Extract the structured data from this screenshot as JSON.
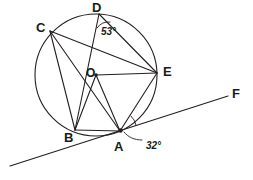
{
  "figure": {
    "type": "circle-geometry-diagram",
    "background_color": "#ffffff",
    "stroke_color": "#231f20",
    "canvas": {
      "width": 253,
      "height": 180
    }
  },
  "circle": {
    "center_label": "O",
    "center": {
      "x": 96,
      "y": 75
    },
    "radius": 61
  },
  "points": [
    {
      "label": "D",
      "x": 99,
      "y": 14,
      "label_x": 92,
      "label_y": 1,
      "name": "point-d"
    },
    {
      "label": "C",
      "x": 50,
      "y": 31,
      "label_x": 36,
      "label_y": 21,
      "name": "point-c"
    },
    {
      "label": "E",
      "x": 157,
      "y": 73,
      "label_x": 163,
      "label_y": 65,
      "name": "point-e"
    },
    {
      "label": "B",
      "x": 75,
      "y": 130,
      "label_x": 64,
      "label_y": 131,
      "name": "point-b"
    },
    {
      "label": "A",
      "x": 120,
      "y": 131,
      "label_x": 114,
      "label_y": 140,
      "name": "point-a"
    },
    {
      "label": "F",
      "x": 228,
      "y": 96,
      "label_x": 232,
      "label_y": 87,
      "name": "point-f"
    }
  ],
  "center_point_label": {
    "text": "O",
    "x": 86,
    "y": 67
  },
  "angles": [
    {
      "label": "53°",
      "at": "D",
      "x": 101,
      "y": 27,
      "name": "angle-label-53"
    },
    {
      "label": "32°",
      "at": "A",
      "x": 146,
      "y": 141,
      "name": "angle-label-32"
    }
  ],
  "chords": [
    {
      "from": "D",
      "to": "E",
      "name": "chord-de"
    },
    {
      "from": "D",
      "to": "B",
      "name": "chord-db"
    },
    {
      "from": "C",
      "to": "E",
      "name": "chord-ce"
    },
    {
      "from": "C",
      "to": "B",
      "name": "chord-cb"
    },
    {
      "from": "C",
      "to": "A",
      "name": "chord-ca"
    },
    {
      "from": "B",
      "to": "A",
      "name": "chord-ba"
    },
    {
      "from": "A",
      "to": "E",
      "name": "chord-ae"
    }
  ],
  "radii": [
    {
      "from": "O",
      "to": "E",
      "name": "radius-oe"
    },
    {
      "from": "O",
      "to": "B",
      "name": "radius-ob"
    },
    {
      "from": "O",
      "to": "A",
      "name": "radius-oa"
    }
  ],
  "tangent": {
    "name": "tangent-line-af",
    "through": "A",
    "end_label": "F",
    "start": {
      "x": 10,
      "y": 166
    },
    "end": {
      "x": 228,
      "y": 96
    }
  },
  "leader_line": {
    "name": "leader-line-32",
    "from": {
      "x": 142,
      "y": 140
    },
    "to": {
      "x": 124,
      "y": 132
    }
  }
}
